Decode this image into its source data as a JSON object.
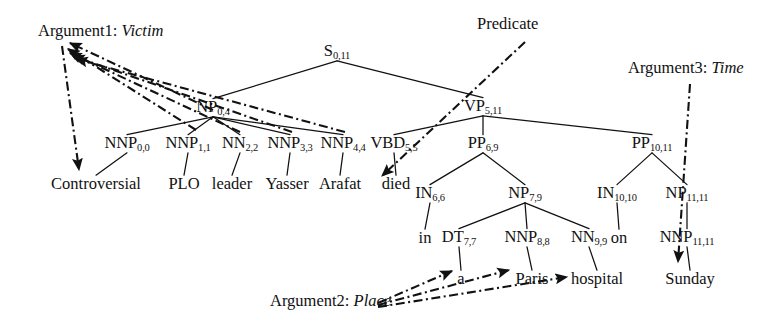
{
  "figure": {
    "kind": "constituency-parse-tree-with-semantic-role-annotations",
    "sentence": "Controversial PLO leader Yasser Arafat died in a Paris hospital on Sunday",
    "colors": {
      "background": "#ffffff",
      "ink": "#111111",
      "tree_edge": "#111111",
      "annotation_edge": "#111111"
    }
  },
  "tree": {
    "nodes": [
      {
        "id": "S",
        "label": "S",
        "sub": "0,11",
        "x": 337,
        "y": 52
      },
      {
        "id": "NP0_4",
        "label": "NP",
        "sub": "0,4",
        "x": 213,
        "y": 108
      },
      {
        "id": "VP5_11",
        "label": "VP",
        "sub": "5,11",
        "x": 483,
        "y": 107
      },
      {
        "id": "NNP0",
        "label": "NNP",
        "sub": "0,0",
        "x": 127,
        "y": 144
      },
      {
        "id": "NNP1",
        "label": "NNP",
        "sub": "1,1",
        "x": 188,
        "y": 144
      },
      {
        "id": "NN2",
        "label": "NN",
        "sub": "2,2",
        "x": 240,
        "y": 144
      },
      {
        "id": "NNP3",
        "label": "NNP",
        "sub": "3,3",
        "x": 290,
        "y": 144
      },
      {
        "id": "NNP4",
        "label": "NNP",
        "sub": "4,4",
        "x": 343,
        "y": 144
      },
      {
        "id": "VBD5",
        "label": "VBD",
        "sub": "5,5",
        "x": 394,
        "y": 144
      },
      {
        "id": "PP6_9",
        "label": "PP",
        "sub": "6,9",
        "x": 483,
        "y": 144
      },
      {
        "id": "PP10_11",
        "label": "PP",
        "sub": "10,11",
        "x": 652,
        "y": 144
      },
      {
        "id": "IN6",
        "label": "IN",
        "sub": "6,6",
        "x": 430,
        "y": 194
      },
      {
        "id": "NP7_9",
        "label": "NP",
        "sub": "7,9",
        "x": 525,
        "y": 194
      },
      {
        "id": "IN10",
        "label": "IN",
        "sub": "10,10",
        "x": 617,
        "y": 194
      },
      {
        "id": "NP11",
        "label": "NP",
        "sub": "11,11",
        "x": 687,
        "y": 194
      },
      {
        "id": "DT7",
        "label": "DT",
        "sub": "7,7",
        "x": 459,
        "y": 238
      },
      {
        "id": "NNP8",
        "label": "NNP",
        "sub": "8,8",
        "x": 527,
        "y": 238
      },
      {
        "id": "NN9",
        "label": "NN",
        "sub": "9,9",
        "x": 589,
        "y": 238
      },
      {
        "id": "NNP11",
        "label": "NNP",
        "sub": "11,11",
        "x": 687,
        "y": 238
      }
    ],
    "leaves": [
      {
        "id": "w0",
        "text": "Controversial",
        "x": 96,
        "y": 184
      },
      {
        "id": "w1",
        "text": "PLO",
        "x": 184,
        "y": 184
      },
      {
        "id": "w2",
        "text": "leader",
        "x": 232,
        "y": 184
      },
      {
        "id": "w3",
        "text": "Yasser",
        "x": 287,
        "y": 184
      },
      {
        "id": "w4",
        "text": "Arafat",
        "x": 340,
        "y": 184
      },
      {
        "id": "w5",
        "text": "died",
        "x": 396,
        "y": 184
      },
      {
        "id": "w6",
        "text": "in",
        "x": 425,
        "y": 238
      },
      {
        "id": "w7",
        "text": "a",
        "x": 461,
        "y": 279
      },
      {
        "id": "w8",
        "text": "Paris",
        "x": 532,
        "y": 279
      },
      {
        "id": "w9",
        "text": "hospital",
        "x": 597,
        "y": 279
      },
      {
        "id": "w10",
        "text": "on",
        "x": 619,
        "y": 238
      },
      {
        "id": "w11",
        "text": "Sunday",
        "x": 690,
        "y": 279
      }
    ],
    "edges": [
      {
        "from": "S",
        "to": "NP0_4"
      },
      {
        "from": "S",
        "to": "VP5_11"
      },
      {
        "from": "NP0_4",
        "to": "NNP0"
      },
      {
        "from": "NP0_4",
        "to": "NNP1"
      },
      {
        "from": "NP0_4",
        "to": "NN2"
      },
      {
        "from": "NP0_4",
        "to": "NNP3"
      },
      {
        "from": "NP0_4",
        "to": "NNP4"
      },
      {
        "from": "VP5_11",
        "to": "VBD5"
      },
      {
        "from": "VP5_11",
        "to": "PP6_9"
      },
      {
        "from": "VP5_11",
        "to": "PP10_11"
      },
      {
        "from": "PP6_9",
        "to": "IN6"
      },
      {
        "from": "PP6_9",
        "to": "NP7_9"
      },
      {
        "from": "PP10_11",
        "to": "IN10"
      },
      {
        "from": "PP10_11",
        "to": "NP11"
      },
      {
        "from": "NP7_9",
        "to": "DT7"
      },
      {
        "from": "NP7_9",
        "to": "NNP8"
      },
      {
        "from": "NP7_9",
        "to": "NN9"
      },
      {
        "from": "NNP0",
        "to": "w0"
      },
      {
        "from": "NNP1",
        "to": "w1"
      },
      {
        "from": "NN2",
        "to": "w2"
      },
      {
        "from": "NNP3",
        "to": "w3"
      },
      {
        "from": "NNP4",
        "to": "w4"
      },
      {
        "from": "VBD5",
        "to": "w5"
      },
      {
        "from": "IN6",
        "to": "w6"
      },
      {
        "from": "DT7",
        "to": "w7"
      },
      {
        "from": "NNP8",
        "to": "w8"
      },
      {
        "from": "NN9",
        "to": "w9"
      },
      {
        "from": "IN10",
        "to": "w10"
      },
      {
        "from": "NP11",
        "to": "NNP11"
      },
      {
        "from": "NNP11",
        "to": "w11"
      }
    ]
  },
  "annotations": [
    {
      "id": "arg1",
      "prefix": "Argument1:",
      "role": "Victim",
      "x": 38,
      "y": 31
    },
    {
      "id": "predicate",
      "prefix": "Predicate",
      "role": "",
      "x": 477,
      "y": 24
    },
    {
      "id": "arg3",
      "prefix": "Argument3:",
      "role": "Time",
      "x": 628,
      "y": 68
    },
    {
      "id": "arg2",
      "prefix": "Argument2:",
      "role": "Place",
      "x": 270,
      "y": 301
    }
  ],
  "annotation_links": [
    {
      "id": "a1-l1",
      "target": "NNP0-tag",
      "from": [
        213,
        110
      ],
      "to": [
        70,
        43
      ]
    },
    {
      "id": "a1-l2",
      "target": "NNP1-tag",
      "from": [
        196,
        130
      ],
      "to": [
        68,
        49
      ]
    },
    {
      "id": "a1-l3",
      "target": "NN2-tag",
      "from": [
        240,
        132
      ],
      "to": [
        70,
        53
      ]
    },
    {
      "id": "a1-l4",
      "target": "NNP3-tag",
      "from": [
        292,
        132
      ],
      "to": [
        73,
        56
      ]
    },
    {
      "id": "a1-l5",
      "target": "NNP4-tag",
      "from": [
        345,
        132
      ],
      "to": [
        76,
        59
      ]
    },
    {
      "id": "a1-l6",
      "target": "w0-word",
      "from": [
        62,
        46
      ],
      "to": [
        79,
        170
      ]
    },
    {
      "id": "pred",
      "target": "w5-word",
      "from": [
        525,
        42
      ],
      "to": [
        382,
        176
      ]
    },
    {
      "id": "a3",
      "target": "w11-word",
      "from": [
        690,
        84
      ],
      "to": [
        678,
        262
      ]
    },
    {
      "id": "a2-l1",
      "target": "w7-word",
      "from": [
        378,
        303
      ],
      "to": [
        452,
        271
      ]
    },
    {
      "id": "a2-l2",
      "target": "w8-word",
      "from": [
        378,
        305
      ],
      "to": [
        509,
        270
      ]
    },
    {
      "id": "a2-l3",
      "target": "w9-word",
      "from": [
        378,
        307
      ],
      "to": [
        567,
        277
      ]
    }
  ]
}
